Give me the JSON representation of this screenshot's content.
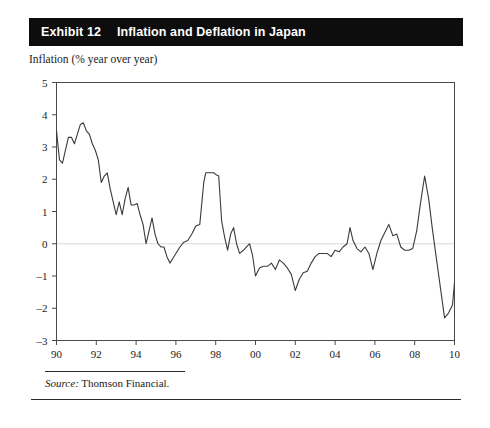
{
  "exhibit": {
    "number": "Exhibit 12",
    "title": "Inflation and Deflation in Japan",
    "header_bg": "#0d0d0d",
    "header_fg": "#ffffff"
  },
  "axis_caption": "Inflation (% year over year)",
  "source": {
    "label": "Source:",
    "text": " Thomson Financial."
  },
  "chart_data": {
    "type": "line",
    "title": "Inflation and Deflation in Japan",
    "subtitle": "Inflation (% year over year)",
    "xlabel": "",
    "ylabel": "Inflation (% year over year)",
    "xlim": [
      1990,
      2010
    ],
    "ylim": [
      -3,
      5
    ],
    "ytick_labels": [
      "5",
      "4",
      "3",
      "2",
      "1",
      "0",
      "-1",
      "-2",
      "-3"
    ],
    "ytick_values": [
      5,
      4,
      3,
      2,
      1,
      0,
      -1,
      -2,
      -3
    ],
    "xtick_labels": [
      "90",
      "92",
      "94",
      "96",
      "98",
      "00",
      "02",
      "04",
      "06",
      "08",
      "10"
    ],
    "xtick_values": [
      1990,
      1992,
      1994,
      1996,
      1998,
      2000,
      2002,
      2004,
      2006,
      2008,
      2010
    ],
    "grid": "zero-line-only",
    "zero_line_color": "#d8d8d8",
    "line_color": "#3a3a3a",
    "legend": null,
    "series": [
      {
        "name": "Japan CPI inflation (% year over year)",
        "x": [
          1990.0,
          1990.15,
          1990.3,
          1990.45,
          1990.6,
          1990.75,
          1990.9,
          1991.05,
          1991.2,
          1991.35,
          1991.5,
          1991.65,
          1991.8,
          1991.95,
          1992.1,
          1992.25,
          1992.4,
          1992.55,
          1992.7,
          1992.85,
          1993.0,
          1993.15,
          1993.3,
          1993.45,
          1993.6,
          1993.75,
          1993.9,
          1994.05,
          1994.2,
          1994.35,
          1994.5,
          1994.65,
          1994.8,
          1994.95,
          1995.1,
          1995.25,
          1995.4,
          1995.55,
          1995.7,
          1995.85,
          1996.0,
          1996.2,
          1996.4,
          1996.6,
          1996.8,
          1997.0,
          1997.2,
          1997.4,
          1997.5,
          1997.7,
          1997.9,
          1998.0,
          1998.15,
          1998.3,
          1998.45,
          1998.6,
          1998.75,
          1998.9,
          1999.05,
          1999.2,
          1999.4,
          1999.55,
          1999.7,
          1999.85,
          2000.0,
          2000.2,
          2000.4,
          2000.6,
          2000.8,
          2001.0,
          2001.2,
          2001.4,
          2001.6,
          2001.8,
          2002.0,
          2002.2,
          2002.4,
          2002.6,
          2002.8,
          2003.0,
          2003.2,
          2003.4,
          2003.6,
          2003.8,
          2004.0,
          2004.2,
          2004.4,
          2004.6,
          2004.75,
          2004.9,
          2005.1,
          2005.3,
          2005.5,
          2005.7,
          2005.9,
          2006.1,
          2006.3,
          2006.5,
          2006.7,
          2006.9,
          2007.1,
          2007.3,
          2007.5,
          2007.7,
          2007.9,
          2008.1,
          2008.3,
          2008.5,
          2008.7,
          2008.9,
          2009.1,
          2009.3,
          2009.5,
          2009.7,
          2009.9,
          2010.0
        ],
        "values": [
          3.5,
          2.6,
          2.5,
          2.9,
          3.3,
          3.3,
          3.1,
          3.4,
          3.7,
          3.75,
          3.5,
          3.4,
          3.1,
          2.9,
          2.6,
          1.9,
          2.1,
          2.2,
          1.7,
          1.3,
          0.9,
          1.3,
          0.9,
          1.4,
          1.75,
          1.2,
          1.2,
          1.25,
          0.9,
          0.6,
          0.0,
          0.4,
          0.8,
          0.3,
          0.0,
          -0.1,
          -0.1,
          -0.4,
          -0.6,
          -0.45,
          -0.3,
          -0.1,
          0.05,
          0.1,
          0.3,
          0.55,
          0.6,
          1.9,
          2.2,
          2.2,
          2.2,
          2.15,
          2.1,
          0.7,
          0.2,
          -0.2,
          0.3,
          0.5,
          0.0,
          -0.3,
          -0.2,
          -0.1,
          0.0,
          -0.35,
          -1.0,
          -0.75,
          -0.7,
          -0.7,
          -0.6,
          -0.8,
          -0.5,
          -0.6,
          -0.75,
          -0.95,
          -1.45,
          -1.1,
          -0.9,
          -0.85,
          -0.6,
          -0.4,
          -0.3,
          -0.3,
          -0.3,
          -0.4,
          -0.2,
          -0.25,
          -0.1,
          0.0,
          0.5,
          0.1,
          -0.15,
          -0.25,
          -0.1,
          -0.3,
          -0.8,
          -0.3,
          0.1,
          0.35,
          0.6,
          0.25,
          0.3,
          -0.1,
          -0.2,
          -0.2,
          -0.15,
          0.4,
          1.3,
          2.1,
          1.4,
          0.4,
          -0.5,
          -1.4,
          -2.3,
          -2.15,
          -1.9,
          -1.2
        ]
      }
    ]
  }
}
